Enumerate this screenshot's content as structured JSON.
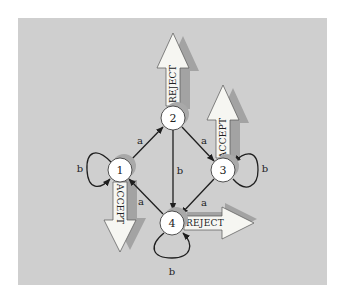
{
  "diagram": {
    "type": "finite-state-automaton",
    "background_color": "#cfcfcf",
    "nodes": [
      {
        "id": "1",
        "label": "1",
        "x": 120,
        "y": 170,
        "output": "ACCEPT",
        "output_direction": "down"
      },
      {
        "id": "2",
        "label": "2",
        "x": 173,
        "y": 118,
        "output": "REJECT",
        "output_direction": "up"
      },
      {
        "id": "3",
        "label": "3",
        "x": 223,
        "y": 170,
        "output": "ACCEPT",
        "output_direction": "up"
      },
      {
        "id": "4",
        "label": "4",
        "x": 172,
        "y": 223,
        "output": "REJECT",
        "output_direction": "right"
      }
    ],
    "edges": [
      {
        "from": "1",
        "to": "2",
        "label": "a"
      },
      {
        "from": "1",
        "to": "1",
        "label": "b"
      },
      {
        "from": "2",
        "to": "3",
        "label": "a"
      },
      {
        "from": "2",
        "to": "4",
        "label": "b"
      },
      {
        "from": "3",
        "to": "4",
        "label": "a"
      },
      {
        "from": "3",
        "to": "3",
        "label": "b"
      },
      {
        "from": "4",
        "to": "1",
        "label": "a"
      },
      {
        "from": "4",
        "to": "4",
        "label": "b"
      }
    ]
  },
  "labels": {
    "node1": "1",
    "node2": "2",
    "node3": "3",
    "node4": "4",
    "edge_1_2": "a",
    "edge_1_1": "b",
    "edge_2_3": "a",
    "edge_2_4": "b",
    "edge_3_4": "a",
    "edge_3_3": "b",
    "edge_4_1": "a",
    "edge_4_4": "b",
    "output1": "ACCEPT",
    "output2": "REJECT",
    "output3": "ACCEPT",
    "output4": "REJECT"
  }
}
